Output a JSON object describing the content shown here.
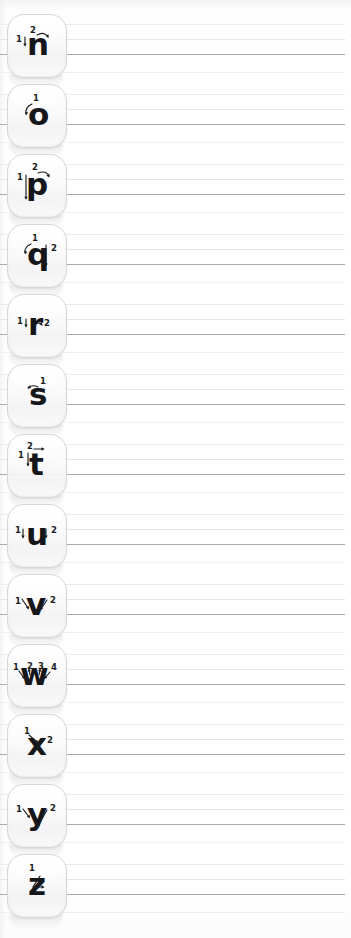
{
  "worksheet": {
    "title": "Lowercase letter formation practice rows",
    "letter_count": 13,
    "row_height_px": 70,
    "colors": {
      "baseline": "#a9abaf",
      "guide_line": "#ebebec",
      "descender_line": "#efeff0",
      "key_border": "#d6d7da",
      "glyph": "#15161a",
      "page_background": "#ffffff"
    },
    "guide_lines": [
      "top",
      "mid",
      "base",
      "desc"
    ]
  },
  "rows": [
    {
      "letter": "n",
      "name": "letter-n",
      "stroke_count": 2,
      "stroke_numbers": [
        "1",
        "2"
      ],
      "strokes": [
        {
          "number": "1",
          "type": "vertical-down",
          "arrow": "down"
        },
        {
          "number": "2",
          "type": "arch-over",
          "arrow": "curve-right"
        }
      ]
    },
    {
      "letter": "o",
      "name": "letter-o",
      "stroke_count": 1,
      "stroke_numbers": [
        "1"
      ],
      "strokes": [
        {
          "number": "1",
          "type": "circle-counterclockwise",
          "arrow": "curve-left-down"
        }
      ]
    },
    {
      "letter": "p",
      "name": "letter-p",
      "stroke_count": 2,
      "stroke_numbers": [
        "1",
        "2"
      ],
      "strokes": [
        {
          "number": "1",
          "type": "vertical-down-descender",
          "arrow": "down"
        },
        {
          "number": "2",
          "type": "bowl-right",
          "arrow": "curve-right"
        }
      ]
    },
    {
      "letter": "q",
      "name": "letter-q",
      "stroke_count": 2,
      "stroke_numbers": [
        "1",
        "2"
      ],
      "strokes": [
        {
          "number": "1",
          "type": "circle-counterclockwise",
          "arrow": "curve-left-down"
        },
        {
          "number": "2",
          "type": "vertical-down-descender",
          "arrow": "down"
        }
      ]
    },
    {
      "letter": "r",
      "name": "letter-r",
      "stroke_count": 2,
      "stroke_numbers": [
        "1",
        "2"
      ],
      "strokes": [
        {
          "number": "1",
          "type": "vertical-down",
          "arrow": "down"
        },
        {
          "number": "2",
          "type": "shoulder-curve",
          "arrow": "curve-right"
        }
      ]
    },
    {
      "letter": "s",
      "name": "letter-s",
      "stroke_count": 1,
      "stroke_numbers": [
        "1"
      ],
      "strokes": [
        {
          "number": "1",
          "type": "s-curve",
          "arrow": "curve-left"
        }
      ]
    },
    {
      "letter": "t",
      "name": "letter-t",
      "stroke_count": 2,
      "stroke_numbers": [
        "1",
        "2"
      ],
      "strokes": [
        {
          "number": "1",
          "type": "vertical-down",
          "arrow": "down"
        },
        {
          "number": "2",
          "type": "horizontal-cross",
          "arrow": "right"
        }
      ]
    },
    {
      "letter": "u",
      "name": "letter-u",
      "stroke_count": 2,
      "stroke_numbers": [
        "1",
        "2"
      ],
      "strokes": [
        {
          "number": "1",
          "type": "down-and-curve",
          "arrow": "down"
        },
        {
          "number": "2",
          "type": "vertical-down",
          "arrow": "down"
        }
      ]
    },
    {
      "letter": "v",
      "name": "letter-v",
      "stroke_count": 2,
      "stroke_numbers": [
        "1",
        "2"
      ],
      "strokes": [
        {
          "number": "1",
          "type": "diagonal-down-right",
          "arrow": "down-right"
        },
        {
          "number": "2",
          "type": "diagonal-up-right",
          "arrow": "up-right"
        }
      ]
    },
    {
      "letter": "w",
      "name": "letter-w",
      "stroke_count": 4,
      "stroke_numbers": [
        "1",
        "2",
        "3",
        "4"
      ],
      "strokes": [
        {
          "number": "1",
          "type": "diagonal-down-right",
          "arrow": "down-right"
        },
        {
          "number": "2",
          "type": "diagonal-up-right",
          "arrow": "up-right"
        },
        {
          "number": "3",
          "type": "diagonal-down-right",
          "arrow": "down-right"
        },
        {
          "number": "4",
          "type": "diagonal-up-right",
          "arrow": "up-right"
        }
      ]
    },
    {
      "letter": "x",
      "name": "letter-x",
      "stroke_count": 2,
      "stroke_numbers": [
        "1",
        "2"
      ],
      "strokes": [
        {
          "number": "1",
          "type": "diagonal-down-right",
          "arrow": "down-right"
        },
        {
          "number": "2",
          "type": "diagonal-down-left",
          "arrow": "down-left"
        }
      ]
    },
    {
      "letter": "y",
      "name": "letter-y",
      "stroke_count": 2,
      "stroke_numbers": [
        "1",
        "2"
      ],
      "strokes": [
        {
          "number": "1",
          "type": "diagonal-down-right",
          "arrow": "down-right"
        },
        {
          "number": "2",
          "type": "diagonal-down-left-descender",
          "arrow": "down-left"
        }
      ]
    },
    {
      "letter": "z",
      "name": "letter-z",
      "stroke_count": 1,
      "stroke_numbers": [
        "1"
      ],
      "strokes": [
        {
          "number": "1",
          "type": "zigzag",
          "arrow": "right"
        }
      ]
    }
  ]
}
